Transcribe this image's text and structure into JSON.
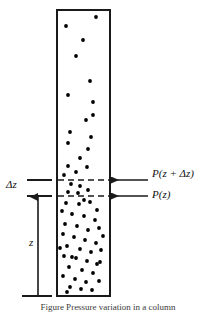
{
  "figure": {
    "type": "diagram",
    "caption": "Figure  Pressure variation in a column",
    "labels": {
      "pressure_top": "P(z + Δz)",
      "pressure_bottom": "P(z)",
      "slab_thickness": "Δz",
      "height": "z"
    },
    "colors": {
      "stroke": "#1a1a1a",
      "dot": "#000000",
      "background": "#ffffff"
    },
    "column": {
      "x": 57,
      "y": 10,
      "width": 53,
      "height": 286,
      "border_width": 2
    },
    "dashed_lines": [
      {
        "name": "upper-boundary",
        "y": 180
      },
      {
        "name": "lower-boundary",
        "y": 196
      }
    ],
    "arrows": [
      {
        "name": "pressure-top-arrow",
        "from_x": 148,
        "to_x": 111,
        "y": 180
      },
      {
        "name": "pressure-bottom-arrow",
        "from_x": 148,
        "to_x": 111,
        "y": 196
      }
    ],
    "ticks": [
      {
        "name": "delta-z-upper-tick",
        "x1": 27,
        "x2": 52,
        "y": 180
      },
      {
        "name": "delta-z-lower-tick",
        "x1": 27,
        "x2": 52,
        "y": 196
      },
      {
        "name": "z-baseline-tick",
        "x1": 22,
        "x2": 52,
        "y": 296
      }
    ],
    "height_arrow": {
      "name": "z-dimension-arrow",
      "x": 38,
      "y_top": 196,
      "y_bottom": 296
    },
    "dots": {
      "radius": 1.9,
      "points": [
        [
          96,
          17
        ],
        [
          66,
          26
        ],
        [
          83,
          40
        ],
        [
          76,
          56
        ],
        [
          90,
          81
        ],
        [
          68,
          95
        ],
        [
          93,
          102
        ],
        [
          86,
          120
        ],
        [
          70,
          132
        ],
        [
          91,
          137
        ],
        [
          93,
          115
        ],
        [
          68,
          143
        ],
        [
          88,
          149
        ],
        [
          80,
          158
        ],
        [
          68,
          166
        ],
        [
          87,
          167
        ],
        [
          76,
          172
        ],
        [
          64,
          175
        ],
        [
          71,
          184
        ],
        [
          80,
          186
        ],
        [
          68,
          192
        ],
        [
          78,
          193
        ],
        [
          88,
          190
        ],
        [
          66,
          203
        ],
        [
          79,
          204
        ],
        [
          90,
          202
        ],
        [
          97,
          210
        ],
        [
          62,
          211
        ],
        [
          72,
          214
        ],
        [
          84,
          216
        ],
        [
          95,
          220
        ],
        [
          65,
          224
        ],
        [
          77,
          226
        ],
        [
          88,
          230
        ],
        [
          99,
          228
        ],
        [
          63,
          234
        ],
        [
          74,
          237
        ],
        [
          85,
          240
        ],
        [
          96,
          243
        ],
        [
          67,
          246
        ],
        [
          80,
          249
        ],
        [
          91,
          252
        ],
        [
          101,
          250
        ],
        [
          64,
          256
        ],
        [
          76,
          258
        ],
        [
          87,
          261
        ],
        [
          97,
          264
        ],
        [
          69,
          267
        ],
        [
          82,
          270
        ],
        [
          93,
          273
        ],
        [
          63,
          276
        ],
        [
          75,
          279
        ],
        [
          86,
          282
        ],
        [
          99,
          281
        ],
        [
          70,
          287
        ],
        [
          81,
          289
        ],
        [
          92,
          290
        ],
        [
          67,
          292
        ],
        [
          103,
          236
        ],
        [
          60,
          248
        ],
        [
          100,
          262
        ],
        [
          72,
          257
        ],
        [
          84,
          200
        ]
      ]
    }
  }
}
